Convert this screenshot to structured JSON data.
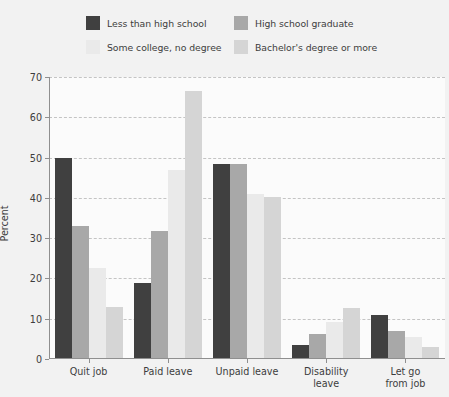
{
  "chart_data": {
    "type": "bar",
    "title": "",
    "xlabel": "",
    "ylabel": "Percent",
    "ylim": [
      0,
      70
    ],
    "ytick_step": 10,
    "yticks": [
      0,
      10,
      20,
      30,
      40,
      50,
      60,
      70
    ],
    "grid": true,
    "legend_position": "top",
    "categories": [
      "Quit job",
      "Paid leave",
      "Unpaid leave",
      "Disability\nleave",
      "Let go\nfrom job"
    ],
    "series": [
      {
        "name": "Less than high school",
        "color": "#404040",
        "values": [
          50.0,
          18.8,
          48.5,
          3.6,
          11.0
        ]
      },
      {
        "name": "High school graduate",
        "color": "#a8a8a8",
        "values": [
          33.0,
          31.7,
          48.5,
          6.3,
          6.9
        ]
      },
      {
        "name": "Some college, no degree",
        "color": "#eaeaea",
        "values": [
          22.7,
          46.8,
          41.0,
          9.2,
          5.5
        ]
      },
      {
        "name": "Bachelor's degree or more",
        "color": "#d5d5d5",
        "values": [
          12.8,
          66.5,
          40.3,
          12.7,
          3.1
        ]
      }
    ]
  },
  "colors": {
    "page_background": "#f2f2f2",
    "plot_background": "#fbfbfb",
    "axis": "#8f8f8f",
    "gridline": "#c4c4c4",
    "text": "#3d3d3d"
  }
}
